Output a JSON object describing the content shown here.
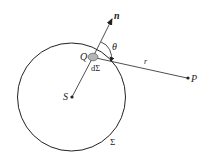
{
  "diagram": {
    "type": "geometry",
    "labels": {
      "normal": "n",
      "angle": "θ",
      "point_q": "Q",
      "area_element": "dΣ",
      "distance": "r",
      "point_p": "P",
      "source": "S",
      "surface": "Σ"
    },
    "elements": {
      "surface_circle": {
        "cx": 71.5,
        "cy": 97,
        "r": 54
      },
      "source_point": {
        "x": 72,
        "y": 97
      },
      "area_patch": {
        "x": 93,
        "y": 57
      },
      "normal_tip": {
        "x": 112,
        "y": 18
      },
      "observer_point": {
        "x": 188,
        "y": 78
      }
    },
    "colors": {
      "stroke": "#222222",
      "patch_fill": "#b5b5b5",
      "background": "#ffffff"
    }
  }
}
